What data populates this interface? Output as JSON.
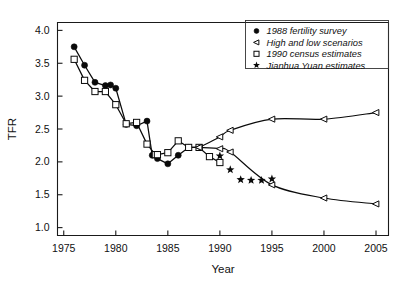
{
  "chart_data": {
    "type": "line",
    "title": "",
    "xlabel": "Year",
    "ylabel": "TFR",
    "xlim": [
      1974.4,
      2006.2
    ],
    "ylim": [
      0.88,
      4.12
    ],
    "xticks": [
      1975,
      1980,
      1985,
      1990,
      1995,
      2000,
      2005
    ],
    "yticks": [
      1.0,
      1.5,
      2.0,
      2.5,
      3.0,
      3.5,
      4.0
    ],
    "ytick_labels": [
      "1.0",
      "1.5",
      "2.0",
      "2.5",
      "3.0",
      "3.5",
      "4.0"
    ],
    "xtick_labels": [
      "1975",
      "1980",
      "1985",
      "1990",
      "1995",
      "2000",
      "2005"
    ],
    "grid": false,
    "legend_position": "top-right",
    "series": [
      {
        "name": "1988 fertility survey",
        "marker": "filled-circle",
        "line": true,
        "x": [
          1976,
          1977,
          1978,
          1979,
          1979.5,
          1980,
          1981,
          1982,
          1983,
          1983.5,
          1984,
          1985,
          1986,
          1987,
          1988
        ],
        "values": [
          3.75,
          3.47,
          3.21,
          3.16,
          3.17,
          3.12,
          2.57,
          2.55,
          2.62,
          2.1,
          2.05,
          1.97,
          2.1,
          2.22,
          2.22
        ]
      },
      {
        "name": "1990 census estimates",
        "marker": "open-square",
        "line": true,
        "x": [
          1976,
          1977,
          1978,
          1979,
          1980,
          1981,
          1982,
          1983,
          1983.8,
          1984,
          1985,
          1986,
          1987,
          1988,
          1989,
          1990
        ],
        "values": [
          3.56,
          3.24,
          3.07,
          3.07,
          2.87,
          2.58,
          2.6,
          2.27,
          2.11,
          2.11,
          2.14,
          2.32,
          2.22,
          2.22,
          2.08,
          1.99
        ]
      },
      {
        "name": "High and low scenarios",
        "marker": "open-triangle-left",
        "line": true,
        "scenario": "high",
        "x": [
          1988,
          1990,
          1991,
          1995,
          2000,
          2005
        ],
        "values": [
          2.22,
          2.38,
          2.48,
          2.65,
          2.65,
          2.75
        ]
      },
      {
        "name": "High and low scenarios",
        "marker": "open-triangle-left",
        "line": true,
        "scenario": "low",
        "x": [
          1988,
          1990,
          1991,
          1995,
          2000,
          2005
        ],
        "values": [
          2.22,
          2.2,
          2.15,
          1.65,
          1.45,
          1.36
        ]
      },
      {
        "name": "Jianhua Yuan estimates",
        "marker": "star",
        "line": false,
        "x": [
          1990,
          1991,
          1992,
          1993,
          1994,
          1995
        ],
        "values": [
          2.09,
          1.88,
          1.73,
          1.72,
          1.72,
          1.74
        ]
      }
    ],
    "legend": [
      {
        "label": "1988 fertility survey",
        "marker": "filled-circle"
      },
      {
        "label": "High and low scenarios",
        "marker": "open-triangle-left"
      },
      {
        "label": "1990 census estimates",
        "marker": "open-square"
      },
      {
        "label": "Jianhua Yuan estimates",
        "marker": "star"
      }
    ],
    "colors": {
      "line": "#0a0a0a",
      "marker_fill": "#0a0a0a",
      "marker_open_fill": "#ffffff",
      "axis": "#1a1a1a",
      "background": "#ffffff"
    }
  }
}
